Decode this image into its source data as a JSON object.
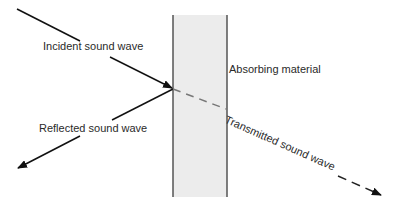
{
  "diagram": {
    "labels": {
      "incident": "Incident sound wave",
      "absorbing": "Absorbing material",
      "reflected": "Reflected sound wave",
      "transmitted": "Transmitted sound wave"
    },
    "colors": {
      "line": "#111111",
      "material_fill": "#ececec",
      "material_border": "#555555",
      "text": "#2a2a2a",
      "transmitted_dash": "#333333"
    }
  }
}
